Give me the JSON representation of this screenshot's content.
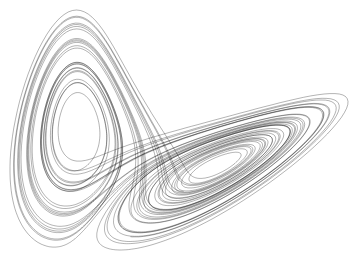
{
  "figure": {
    "background": "#ffffff",
    "stroke": "#000000",
    "stroke_opacity": 0.55,
    "stroke_width": 0.55
  },
  "attractor": {
    "sigma": 10,
    "rho": 28,
    "beta": 2.6667,
    "dt": 0.005,
    "steps": 9000,
    "start": [
      -8,
      8,
      27
    ],
    "lobe_left_center": [
      108,
      140
    ],
    "lobe_right_center": [
      245,
      125
    ]
  }
}
